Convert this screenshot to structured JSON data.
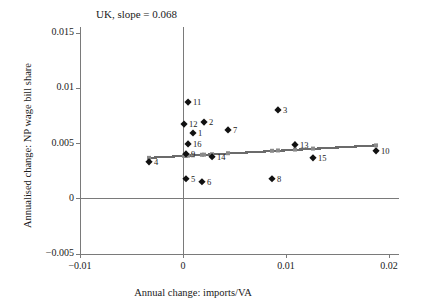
{
  "chart_data": {
    "type": "scatter",
    "title": "UK, slope = 0.068",
    "xlabel": "Annual change: imports/VA",
    "ylabel": "Annualised change: NP wage bill share",
    "xlim": [
      -0.01,
      0.021
    ],
    "ylim": [
      -0.005,
      0.0155
    ],
    "xticks": [
      -0.01,
      0,
      0.01,
      0.02
    ],
    "xtick_labels": [
      "−0.01",
      "0",
      "0.01",
      "0.02"
    ],
    "yticks": [
      -0.005,
      0,
      0.005,
      0.01,
      0.015
    ],
    "ytick_labels": [
      "−0.005",
      "0",
      "0.005",
      "0.01",
      "0.015"
    ],
    "grid": false,
    "legend": null,
    "slope": 0.068,
    "points": [
      {
        "label": "11",
        "x": 0.00049,
        "y": 0.00875
      },
      {
        "label": "12",
        "x": 0.0001,
        "y": 0.00676
      },
      {
        "label": "2",
        "x": 0.00204,
        "y": 0.00694
      },
      {
        "label": "1",
        "x": 0.00097,
        "y": 0.00595
      },
      {
        "label": "7",
        "x": 0.00437,
        "y": 0.00623
      },
      {
        "label": "3",
        "x": 0.00922,
        "y": 0.00804
      },
      {
        "label": "16",
        "x": 0.00049,
        "y": 0.00496
      },
      {
        "label": "9",
        "x": 0.00029,
        "y": 0.00406
      },
      {
        "label": "13",
        "x": 0.01087,
        "y": 0.00489
      },
      {
        "label": "10",
        "x": 0.01874,
        "y": 0.00434
      },
      {
        "label": "14",
        "x": 0.00282,
        "y": 0.0038
      },
      {
        "label": "4",
        "x": -0.0033,
        "y": 0.00334
      },
      {
        "label": "15",
        "x": 0.01262,
        "y": 0.0037
      },
      {
        "label": "5",
        "x": 0.00029,
        "y": 0.00181
      },
      {
        "label": "6",
        "x": 0.00184,
        "y": 0.00154
      },
      {
        "label": "8",
        "x": 0.00864,
        "y": 0.00181
      }
    ],
    "fit_line": {
      "x_start": -0.0033,
      "y_start": 0.0037,
      "x_end": 0.01874,
      "y_end": 0.00483,
      "color": "#6b6b6b"
    },
    "fit_markers": [
      {
        "x": -0.0033,
        "y": 0.0037
      },
      {
        "x": 0.0001,
        "y": 0.00388
      },
      {
        "x": 0.00029,
        "y": 0.00389
      },
      {
        "x": 0.00049,
        "y": 0.0039
      },
      {
        "x": 0.00097,
        "y": 0.00393
      },
      {
        "x": 0.00184,
        "y": 0.00398
      },
      {
        "x": 0.00204,
        "y": 0.00399
      },
      {
        "x": 0.00282,
        "y": 0.00403
      },
      {
        "x": 0.00437,
        "y": 0.00412
      },
      {
        "x": 0.00864,
        "y": 0.00434
      },
      {
        "x": 0.00922,
        "y": 0.00437
      },
      {
        "x": 0.01087,
        "y": 0.00445
      },
      {
        "x": 0.01262,
        "y": 0.00454
      },
      {
        "x": 0.01874,
        "y": 0.00483
      }
    ],
    "marker_color": "#111111",
    "axis_color": "#7a7a7a"
  }
}
